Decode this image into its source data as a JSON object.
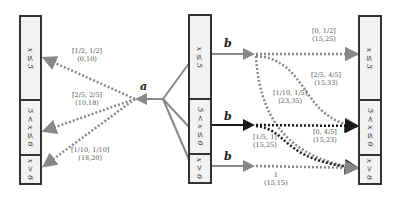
{
  "columns": {
    "left": {
      "cells": [
        "x ≤ 5",
        "5 < x ≤ 6",
        "x > 6"
      ]
    },
    "middle": {
      "cells": [
        "x ≤ 5",
        "5 < x ≤ 6",
        "x > 6"
      ]
    },
    "right": {
      "cells": [
        "x ≤ 5",
        "5 < x ≤ 6",
        "x > 6"
      ]
    }
  },
  "actions": {
    "a": "a",
    "b1": "b",
    "b2": "b",
    "b3": "b"
  },
  "left_edges": [
    {
      "prob": "[1/2, 1/2]",
      "reward": "(0,10)"
    },
    {
      "prob": "[2/5, 2/5]",
      "reward": "(10,18)"
    },
    {
      "prob": "[1/10, 1/10]",
      "reward": "(18,20)"
    }
  ],
  "right_edges": [
    {
      "prob": "[0, 1/2]",
      "reward": "(15,25)"
    },
    {
      "prob": "[2/5, 4/5]",
      "reward": "(15,33)"
    },
    {
      "prob": "[1/10, 1/5]",
      "reward": "(23,35)"
    },
    {
      "prob": "[0, 4/5]",
      "reward": "(15,23)"
    },
    {
      "prob": "[1/5, 1]",
      "reward": "(15,25)"
    },
    {
      "prob": "1",
      "reward": "(15,15)"
    }
  ],
  "colors": {
    "gray": "#888888",
    "dark": "#1a1a1a",
    "border": "#333333",
    "fill": "#f2f2f2"
  }
}
